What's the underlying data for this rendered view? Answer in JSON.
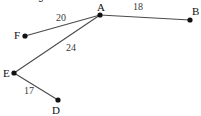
{
  "page": {
    "clipped_heading": "Prim's algorithm.",
    "background_color": "#ffffff",
    "edge_color": "#4a4a4a",
    "node_color": "#111111",
    "label_color": "#111111",
    "weight_color": "#3a3a3a"
  },
  "graph_data": {
    "type": "graph",
    "title": "Prim's algorithm.",
    "directed": false,
    "nodes": [
      {
        "id": "A",
        "label": "A",
        "x": 100,
        "y": 15,
        "label_x": 97,
        "label_y": 2
      },
      {
        "id": "B",
        "label": "B",
        "x": 190,
        "y": 20,
        "label_x": 192,
        "label_y": 6
      },
      {
        "id": "D",
        "label": "D",
        "x": 58,
        "y": 100,
        "label_x": 52,
        "label_y": 105
      },
      {
        "id": "E",
        "label": "E",
        "x": 14,
        "y": 73,
        "label_x": 3,
        "label_y": 68
      },
      {
        "id": "F",
        "label": "F",
        "x": 25,
        "y": 36,
        "label_x": 14,
        "label_y": 30
      }
    ],
    "edges": [
      {
        "source": "A",
        "target": "B",
        "weight": "18",
        "label_x": 133,
        "label_y": 2
      },
      {
        "source": "F",
        "target": "A",
        "weight": "20",
        "label_x": 56,
        "label_y": 13
      },
      {
        "source": "E",
        "target": "A",
        "weight": "24",
        "label_x": 66,
        "label_y": 43
      },
      {
        "source": "E",
        "target": "D",
        "weight": "17",
        "label_x": 24,
        "label_y": 86
      }
    ]
  }
}
